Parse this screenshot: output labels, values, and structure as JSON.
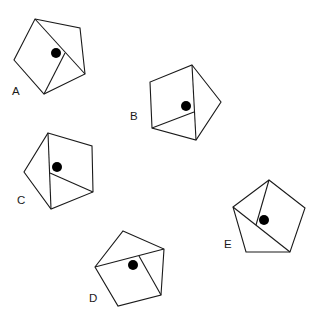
{
  "figure": {
    "width": 322,
    "height": 327,
    "stroke_color": "#1a1a1a",
    "dot_color": "#000000",
    "background": "#ffffff"
  },
  "pentagons": [
    {
      "label": "A",
      "label_pos": [
        12,
        95
      ],
      "vertices": [
        [
          35,
          19
        ],
        [
          80,
          28
        ],
        [
          85,
          74
        ],
        [
          44,
          94
        ],
        [
          14,
          60
        ]
      ],
      "lines": [
        [
          [
            35,
            19
          ],
          [
            85,
            74
          ]
        ],
        [
          [
            65,
            53
          ],
          [
            44,
            94
          ]
        ]
      ],
      "dot": [
        56,
        53,
        5
      ]
    },
    {
      "label": "B",
      "label_pos": [
        130,
        120
      ],
      "vertices": [
        [
          192,
          65
        ],
        [
          221,
          102
        ],
        [
          196,
          140
        ],
        [
          152,
          128
        ],
        [
          150,
          82
        ]
      ],
      "lines": [
        [
          [
            192,
            65
          ],
          [
            196,
            140
          ]
        ],
        [
          [
            152,
            128
          ],
          [
            194,
            112
          ]
        ]
      ],
      "dot": [
        186,
        106,
        5
      ]
    },
    {
      "label": "C",
      "label_pos": [
        17,
        204
      ],
      "vertices": [
        [
          48,
          133
        ],
        [
          92,
          146
        ],
        [
          93,
          192
        ],
        [
          51,
          209
        ],
        [
          24,
          172
        ]
      ],
      "lines": [
        [
          [
            48,
            133
          ],
          [
            51,
            209
          ]
        ],
        [
          [
            50,
            173
          ],
          [
            93,
            192
          ]
        ]
      ],
      "dot": [
        57,
        167,
        5
      ]
    },
    {
      "label": "D",
      "label_pos": [
        89,
        302
      ],
      "vertices": [
        [
          123,
          231
        ],
        [
          164,
          249
        ],
        [
          161,
          295
        ],
        [
          118,
          306
        ],
        [
          95,
          267
        ]
      ],
      "lines": [
        [
          [
            95,
            267
          ],
          [
            164,
            249
          ]
        ],
        [
          [
            139,
            256
          ],
          [
            161,
            295
          ]
        ]
      ],
      "dot": [
        133,
        265,
        5
      ]
    },
    {
      "label": "E",
      "label_pos": [
        224,
        248
      ],
      "vertices": [
        [
          269,
          180
        ],
        [
          305,
          208
        ],
        [
          290,
          252
        ],
        [
          246,
          252
        ],
        [
          233,
          207
        ]
      ],
      "lines": [
        [
          [
            233,
            207
          ],
          [
            290,
            252
          ]
        ],
        [
          [
            269,
            180
          ],
          [
            256,
            225
          ]
        ]
      ],
      "dot": [
        264,
        220,
        5
      ]
    }
  ]
}
